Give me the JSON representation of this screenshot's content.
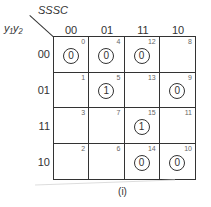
{
  "kmap": {
    "col_var_label": "SSSC",
    "row_var_label": "y₁y₂",
    "columns": [
      "00",
      "01",
      "11",
      "10"
    ],
    "rows": [
      "00",
      "01",
      "11",
      "10"
    ],
    "cells": [
      [
        {
          "index": "0",
          "value": "0"
        },
        {
          "index": "4",
          "value": "0"
        },
        {
          "index": "12",
          "value": "0"
        },
        {
          "index": "8",
          "value": ""
        }
      ],
      [
        {
          "index": "1",
          "value": ""
        },
        {
          "index": "5",
          "value": "1"
        },
        {
          "index": "13",
          "value": ""
        },
        {
          "index": "9",
          "value": "0"
        }
      ],
      [
        {
          "index": "3",
          "value": ""
        },
        {
          "index": "7",
          "value": ""
        },
        {
          "index": "15",
          "value": "1"
        },
        {
          "index": "11",
          "value": ""
        }
      ],
      [
        {
          "index": "2",
          "value": ""
        },
        {
          "index": "6",
          "value": ""
        },
        {
          "index": "14",
          "value": "0"
        },
        {
          "index": "10",
          "value": "0"
        }
      ]
    ],
    "caption": "(i)"
  }
}
